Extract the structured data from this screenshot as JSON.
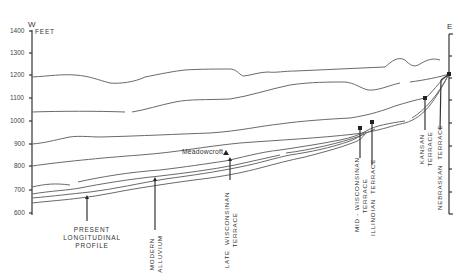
{
  "diagram": {
    "west_label": "W",
    "east_label": "E",
    "unit_label": "FEET",
    "y_ticks": [
      "1400",
      "1300",
      "1200",
      "1100",
      "1000",
      "900",
      "800",
      "700",
      "600"
    ],
    "site_label": "Meadowcroft",
    "labels": {
      "present_profile": [
        "PRESENT",
        "LONGITUDINAL",
        "PROFILE"
      ],
      "modern_alluvium": "MODERN\nALLUVIUM",
      "late_wisconsinan": "LATE  WISCONSINAN\nTERRACE",
      "mid_wisconsinan": "MID - WISCONSINAN\nTERRACE",
      "illinoian": "ILLINOIAN  TERRACE",
      "kansan": "KANSAN\nTERRACE",
      "nebraskan": "NEBRASKAN  TERRACE"
    }
  }
}
